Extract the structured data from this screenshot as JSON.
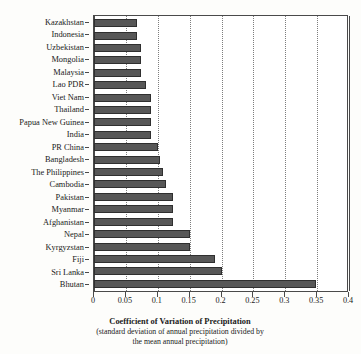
{
  "chart_data": {
    "type": "bar",
    "orientation": "horizontal",
    "title": "",
    "xlabel": "Coefficient of Variation of Precipitation",
    "xlabel_sub": "(standard deviation of annual precipitation divided by the mean annual precipitation)",
    "ylabel": "",
    "xlim": [
      0,
      0.4
    ],
    "xticks": [
      0,
      0.05,
      0.1,
      0.15,
      0.2,
      0.25,
      0.3,
      0.35,
      0.4
    ],
    "xtick_labels": [
      "0",
      "0.05",
      "0.1",
      "0.15",
      "0.2",
      "0.25",
      "0.3",
      "0.35",
      "0.4"
    ],
    "grid": "vertical-dotted",
    "legend": "none",
    "bar_color": "#575757",
    "bar_edge_color": "#2f2f2f",
    "categories": [
      "Kazakhstan",
      "Indonesia",
      "Uzbekistan",
      "Mongolia",
      "Malaysia",
      "Lao PDR",
      "Viet Nam",
      "Thailand",
      "Papua New Guinea",
      "India",
      "PR China",
      "Bangladesh",
      "The Philippines",
      "Cambodia",
      "Pakistan",
      "Myanmar",
      "Afghanistan",
      "Nepal",
      "Kyrgyzstan",
      "Fiji",
      "Sri Lanka",
      "Bhutan"
    ],
    "values": [
      0.068,
      0.068,
      0.074,
      0.074,
      0.074,
      0.082,
      0.09,
      0.09,
      0.09,
      0.09,
      0.1,
      0.103,
      0.108,
      0.113,
      0.124,
      0.124,
      0.124,
      0.15,
      0.15,
      0.19,
      0.2,
      0.348
    ]
  },
  "caption": {
    "title": "Coefficient of Variation of Precipitation",
    "line2": "(standard deviation of annual precipitation divided by",
    "line3": "the mean annual precipitation)"
  }
}
